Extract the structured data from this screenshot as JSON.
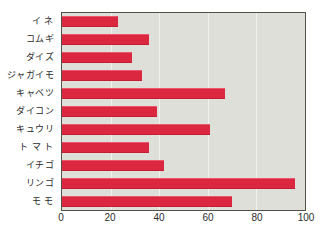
{
  "chart_data": {
    "type": "bar",
    "orientation": "horizontal",
    "title": "",
    "xlabel": "",
    "ylabel": "",
    "categories": [
      "イ ネ",
      "コムギ",
      "ダイズ",
      "ジャガイモ",
      "キャベツ",
      "ダイコン",
      "キュウリ",
      "ト マ ト",
      "イチゴ",
      "リンゴ",
      "モ  モ"
    ],
    "values": [
      23,
      36,
      29,
      33,
      67,
      39,
      61,
      36,
      42,
      96,
      70
    ],
    "xlim": [
      0,
      100
    ],
    "xticks": [
      0,
      20,
      40,
      60,
      80,
      100
    ],
    "xtick_labels": [
      "0",
      "20",
      "40",
      "60",
      "80",
      "100"
    ],
    "grid": true,
    "grid_axis": "x",
    "legend": null,
    "colors": {
      "bar": "#dc2740",
      "plot_background": "#dfdfd9",
      "gridline": "#f3f3ef",
      "axis_border": "#555048",
      "text": "#2b2b2b",
      "page_background": "#ffffff"
    }
  }
}
